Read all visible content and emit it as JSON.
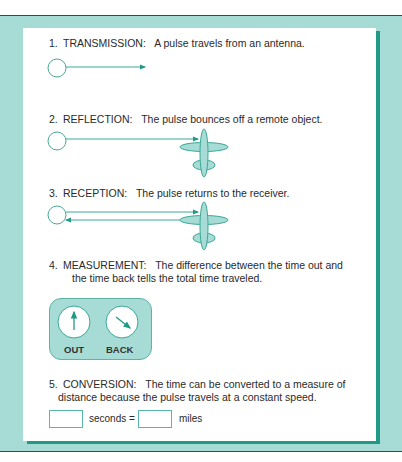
{
  "steps": [
    {
      "num": "1.",
      "title": "TRANSMISSION:",
      "text": "A pulse travels from an antenna."
    },
    {
      "num": "2.",
      "title": "REFLECTION:",
      "text": "The pulse bounces off a remote object."
    },
    {
      "num": "3.",
      "title": "RECEPTION:",
      "text": "The pulse returns to the receiver."
    },
    {
      "num": "4.",
      "title": "MEASUREMENT:",
      "text": "The difference between the time out and",
      "text2": "the time back tells the total time traveled."
    },
    {
      "num": "5.",
      "title": "CONVERSION:",
      "text": "The time can be converted to a measure of",
      "text2": "distance because the pulse travels at a constant speed."
    }
  ],
  "clocks": {
    "out_label": "OUT",
    "back_label": "BACK"
  },
  "conversion": {
    "seconds_label": "seconds =",
    "miles_label": "miles",
    "seconds_value": "",
    "miles_value": ""
  },
  "colors": {
    "teal_bg": "#a6dcd5",
    "teal_dark": "#1f9a86",
    "line": "#3aa896"
  }
}
